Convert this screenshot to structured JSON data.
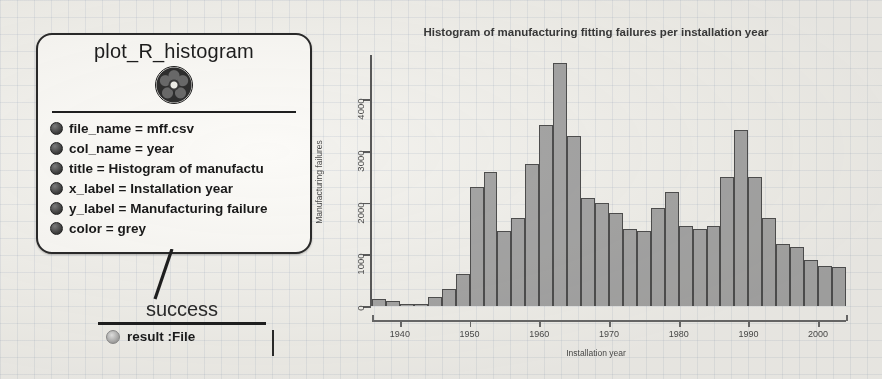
{
  "diagram": {
    "main_node": {
      "title": "plot_R_histogram",
      "icon": "r-script-node-icon",
      "attributes": [
        {
          "label": "file_name",
          "value": "mff.csv",
          "text": "file_name = mff.csv"
        },
        {
          "label": "col_name",
          "value": "year",
          "text": "col_name = year"
        },
        {
          "label": "title",
          "value": "Histogram of manufactu",
          "text": "title = Histogram of manufactu"
        },
        {
          "label": "x_label",
          "value": "Installation year",
          "text": "x_label = Installation year"
        },
        {
          "label": "y_label",
          "value": "Manufacturing failure",
          "text": "y_label = Manufacturing failure"
        },
        {
          "label": "color",
          "value": "grey",
          "text": "color = grey"
        }
      ]
    },
    "success_node": {
      "title": "success",
      "port": "result :File",
      "port_icon": "output-port-icon"
    }
  },
  "chart_data": {
    "type": "bar",
    "title": "Histogram of manufacturing fitting failures per installation year",
    "xlabel": "Installation year",
    "ylabel": "Manufacturing failures",
    "xlim": [
      1936,
      2004
    ],
    "ylim": [
      0,
      4800
    ],
    "xticks": [
      1940,
      1950,
      1960,
      1970,
      1980,
      1990,
      2000
    ],
    "ytick_labels": [
      "0",
      "1000",
      "2000",
      "3000",
      "4000"
    ],
    "yticks": [
      0,
      1000,
      2000,
      3000,
      4000
    ],
    "grid": false,
    "legend": null,
    "bin_width": 2,
    "bar_color": "#a6a6a6",
    "bar_edge_color": "#4f4f4f",
    "categories": [
      "1936",
      "1938",
      "1940",
      "1942",
      "1944",
      "1946",
      "1948",
      "1950",
      "1952",
      "1954",
      "1956",
      "1958",
      "1960",
      "1962",
      "1964",
      "1966",
      "1968",
      "1970",
      "1972",
      "1974",
      "1976",
      "1978",
      "1980",
      "1982",
      "1984",
      "1986",
      "1988",
      "1990",
      "1992",
      "1994",
      "1996",
      "1998",
      "2000",
      "2002"
    ],
    "values": [
      140,
      90,
      30,
      40,
      170,
      330,
      620,
      2300,
      2600,
      1450,
      1700,
      2750,
      3500,
      4700,
      3300,
      2100,
      2000,
      1800,
      1500,
      1450,
      1900,
      2200,
      1550,
      1500,
      1550,
      2500,
      3400,
      2500,
      1700,
      1200,
      1150,
      900,
      780,
      760
    ]
  }
}
